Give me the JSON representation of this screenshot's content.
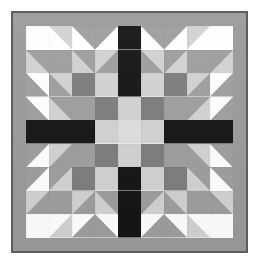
{
  "artwork": {
    "title": "Quilt Block Pattern",
    "kind": "pieced-quilt-block",
    "grid_size": 9,
    "symmetry": "4-fold mirrored",
    "page_background": "#ffffff"
  },
  "frame": {
    "outline_color": "#5e5e5e",
    "outline_width_px": 2,
    "border_color": "#9a9a9a",
    "border_width_px": 13
  },
  "palette": {
    "white": "#ffffff",
    "light": "#d2d2d2",
    "lighter": "#dedede",
    "medium": "#9e9e9e",
    "dark": "#7d7d7d",
    "black": "#141414"
  },
  "legend": [
    {
      "name": "white",
      "swatch": "#ffffff",
      "label": "White background"
    },
    {
      "name": "light",
      "swatch": "#d2d2d2",
      "label": "Light gray"
    },
    {
      "name": "lighter",
      "swatch": "#dedede",
      "label": "Center light"
    },
    {
      "name": "medium",
      "swatch": "#9e9e9e",
      "label": "Medium gray"
    },
    {
      "name": "dark",
      "swatch": "#7d7d7d",
      "label": "Dark gray"
    },
    {
      "name": "black",
      "swatch": "#141414",
      "label": "Black cross"
    }
  ],
  "patches": [
    [
      {
        "type": "solid",
        "fill": "white"
      },
      {
        "type": "tri",
        "fill": "light",
        "base": "white",
        "corner": "tr"
      },
      {
        "type": "tri",
        "fill": "medium",
        "base": "white",
        "corner": "tr"
      },
      {
        "type": "tri",
        "fill": "medium",
        "base": "white",
        "corner": "tl"
      },
      {
        "type": "solid",
        "fill": "black"
      },
      {
        "type": "tri",
        "fill": "medium",
        "base": "white",
        "corner": "tr"
      },
      {
        "type": "tri",
        "fill": "medium",
        "base": "white",
        "corner": "tl"
      },
      {
        "type": "tri",
        "fill": "light",
        "base": "white",
        "corner": "tl"
      },
      {
        "type": "solid",
        "fill": "white"
      }
    ],
    [
      {
        "type": "tri",
        "fill": "light",
        "base": "medium",
        "corner": "bl"
      },
      {
        "type": "solid",
        "fill": "medium"
      },
      {
        "type": "tri",
        "fill": "medium",
        "base": "light",
        "corner": "tr"
      },
      {
        "type": "tri",
        "fill": "light",
        "base": "medium",
        "corner": "tl"
      },
      {
        "type": "solid",
        "fill": "black"
      },
      {
        "type": "tri",
        "fill": "light",
        "base": "medium",
        "corner": "tr"
      },
      {
        "type": "tri",
        "fill": "medium",
        "base": "light",
        "corner": "tl"
      },
      {
        "type": "solid",
        "fill": "medium"
      },
      {
        "type": "tri",
        "fill": "light",
        "base": "medium",
        "corner": "br"
      }
    ],
    [
      {
        "type": "tri",
        "fill": "medium",
        "base": "white",
        "corner": "bl"
      },
      {
        "type": "tri",
        "fill": "light",
        "base": "medium",
        "corner": "tr"
      },
      {
        "type": "solid",
        "fill": "dark"
      },
      {
        "type": "solid",
        "fill": "light"
      },
      {
        "type": "solid",
        "fill": "black"
      },
      {
        "type": "solid",
        "fill": "light"
      },
      {
        "type": "solid",
        "fill": "dark"
      },
      {
        "type": "tri",
        "fill": "light",
        "base": "medium",
        "corner": "tl"
      },
      {
        "type": "tri",
        "fill": "medium",
        "base": "white",
        "corner": "br"
      }
    ],
    [
      {
        "type": "tri",
        "fill": "medium",
        "base": "white",
        "corner": "bl"
      },
      {
        "type": "tri",
        "fill": "light",
        "base": "medium",
        "corner": "bl"
      },
      {
        "type": "solid",
        "fill": "medium"
      },
      {
        "type": "solid",
        "fill": "dark"
      },
      {
        "type": "solid",
        "fill": "light"
      },
      {
        "type": "solid",
        "fill": "dark"
      },
      {
        "type": "solid",
        "fill": "medium"
      },
      {
        "type": "tri",
        "fill": "light",
        "base": "medium",
        "corner": "br"
      },
      {
        "type": "tri",
        "fill": "medium",
        "base": "white",
        "corner": "br"
      }
    ],
    [
      {
        "type": "solid",
        "fill": "black"
      },
      {
        "type": "solid",
        "fill": "black"
      },
      {
        "type": "solid",
        "fill": "black"
      },
      {
        "type": "solid",
        "fill": "light"
      },
      {
        "type": "solid",
        "fill": "lighter"
      },
      {
        "type": "solid",
        "fill": "light"
      },
      {
        "type": "solid",
        "fill": "black"
      },
      {
        "type": "solid",
        "fill": "black"
      },
      {
        "type": "solid",
        "fill": "black"
      }
    ],
    [
      {
        "type": "tri",
        "fill": "medium",
        "base": "white",
        "corner": "tl"
      },
      {
        "type": "tri",
        "fill": "light",
        "base": "medium",
        "corner": "tl"
      },
      {
        "type": "solid",
        "fill": "medium"
      },
      {
        "type": "solid",
        "fill": "dark"
      },
      {
        "type": "solid",
        "fill": "light"
      },
      {
        "type": "solid",
        "fill": "dark"
      },
      {
        "type": "solid",
        "fill": "medium"
      },
      {
        "type": "tri",
        "fill": "light",
        "base": "medium",
        "corner": "tr"
      },
      {
        "type": "tri",
        "fill": "medium",
        "base": "white",
        "corner": "tr"
      }
    ],
    [
      {
        "type": "tri",
        "fill": "medium",
        "base": "white",
        "corner": "tl"
      },
      {
        "type": "tri",
        "fill": "light",
        "base": "medium",
        "corner": "br"
      },
      {
        "type": "solid",
        "fill": "dark"
      },
      {
        "type": "solid",
        "fill": "light"
      },
      {
        "type": "solid",
        "fill": "black"
      },
      {
        "type": "solid",
        "fill": "light"
      },
      {
        "type": "solid",
        "fill": "dark"
      },
      {
        "type": "tri",
        "fill": "light",
        "base": "medium",
        "corner": "bl"
      },
      {
        "type": "tri",
        "fill": "medium",
        "base": "white",
        "corner": "tr"
      }
    ],
    [
      {
        "type": "tri",
        "fill": "light",
        "base": "medium",
        "corner": "tl"
      },
      {
        "type": "solid",
        "fill": "medium"
      },
      {
        "type": "tri",
        "fill": "medium",
        "base": "light",
        "corner": "br"
      },
      {
        "type": "tri",
        "fill": "light",
        "base": "medium",
        "corner": "bl"
      },
      {
        "type": "solid",
        "fill": "black"
      },
      {
        "type": "tri",
        "fill": "light",
        "base": "medium",
        "corner": "br"
      },
      {
        "type": "tri",
        "fill": "medium",
        "base": "light",
        "corner": "bl"
      },
      {
        "type": "solid",
        "fill": "medium"
      },
      {
        "type": "tri",
        "fill": "light",
        "base": "medium",
        "corner": "tr"
      }
    ],
    [
      {
        "type": "solid",
        "fill": "white"
      },
      {
        "type": "tri",
        "fill": "light",
        "base": "white",
        "corner": "br"
      },
      {
        "type": "tri",
        "fill": "medium",
        "base": "white",
        "corner": "br"
      },
      {
        "type": "tri",
        "fill": "medium",
        "base": "white",
        "corner": "bl"
      },
      {
        "type": "solid",
        "fill": "black"
      },
      {
        "type": "tri",
        "fill": "medium",
        "base": "white",
        "corner": "br"
      },
      {
        "type": "tri",
        "fill": "medium",
        "base": "white",
        "corner": "bl"
      },
      {
        "type": "tri",
        "fill": "light",
        "base": "white",
        "corner": "bl"
      },
      {
        "type": "solid",
        "fill": "white"
      }
    ]
  ]
}
